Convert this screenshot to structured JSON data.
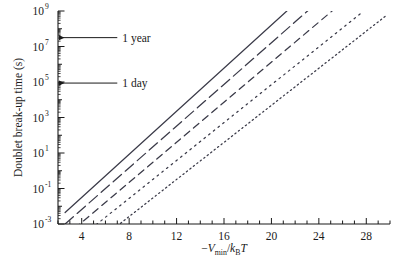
{
  "chart_data": {
    "type": "line",
    "title": "",
    "xlabel": "-V_min/k_B T",
    "ylabel": "Doublet break-up time (s)",
    "xlabel_parts": {
      "minus": "−",
      "v": "V",
      "vsub": "min",
      "slash": "/",
      "k": "k",
      "ksub": "B",
      "t": "T"
    },
    "xlim": [
      2,
      30
    ],
    "ylim_log10": [
      -3,
      9
    ],
    "xscale": "linear",
    "yscale": "log",
    "grid": false,
    "legend": "none",
    "xticks_major": [
      4,
      8,
      12,
      16,
      20,
      24,
      28
    ],
    "xticks_major_labels": [
      "4",
      "8",
      "12",
      "16",
      "20",
      "24",
      "28"
    ],
    "xtick_minor_step": 1,
    "yticks_major_log10": [
      -3,
      -1,
      1,
      3,
      5,
      7,
      9
    ],
    "yticks_major_labels": [
      "10⁻³",
      "10⁻¹",
      "10¹",
      "10³",
      "10⁵",
      "10⁷",
      "10⁹"
    ],
    "ytick_mantissa_labels": [
      "10",
      "10",
      "10",
      "10",
      "10",
      "10",
      "10"
    ],
    "ytick_exponent_labels": [
      "-3",
      "-1",
      "1",
      "3",
      "5",
      "7",
      "9"
    ],
    "annotations": [
      {
        "label": "1 year",
        "y_value_log10": 7.5,
        "arrow": "left",
        "x_text": 7.0
      },
      {
        "label": "1 day",
        "y_value_log10": 4.94,
        "arrow": "left",
        "x_text": 7.0
      }
    ],
    "series": [
      {
        "name": "curve-1",
        "style": "solid",
        "slope_log10_per_unit": 0.5147,
        "x_start": 2.6,
        "x_end": 21.3,
        "y_start_log10": -2.35,
        "y_end_log10": 9.0
      },
      {
        "name": "curve-2",
        "style": "long-dash",
        "slope_log10_per_unit": 0.5147,
        "x_start": 2.6,
        "x_end": 23.3,
        "y_start_log10": -3.0,
        "y_end_log10": 9.15
      },
      {
        "name": "curve-3",
        "style": "medium-dash",
        "slope_log10_per_unit": 0.5147,
        "x_start": 2.6,
        "x_end": 25.2,
        "y_start_log10": -3.7,
        "y_end_log10": 9.05
      },
      {
        "name": "curve-4",
        "style": "dotted-sparse",
        "slope_log10_per_unit": 0.5147,
        "x_start": 2.85,
        "x_end": 27.6,
        "y_start_log10": -4.3,
        "y_end_log10": 8.9
      },
      {
        "name": "curve-5",
        "style": "dotted-fine",
        "slope_log10_per_unit": 0.5147,
        "x_start": 2.6,
        "x_end": 29.6,
        "y_start_log10": -5.4,
        "y_end_log10": 8.7
      }
    ]
  },
  "colors": {
    "axis": "#1a1a1a",
    "line": "#3a3a48",
    "background": "#ffffff"
  }
}
